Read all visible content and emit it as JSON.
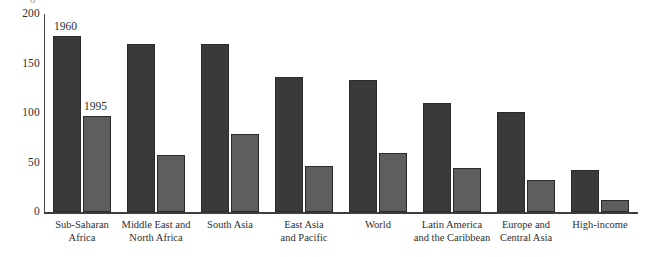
{
  "chart_data": {
    "type": "bar",
    "title": "",
    "xlabel": "",
    "ylabel": "",
    "ylim": [
      0,
      200
    ],
    "yticks": [
      0,
      50,
      100,
      150,
      200
    ],
    "grid": false,
    "legend_position": "inline-annotation",
    "categories": [
      "Sub-Saharan Africa",
      "Middle East and North Africa",
      "South Asia",
      "East Asia and Pacific",
      "World",
      "Latin America and the Caribbean",
      "Europe and Central Asia",
      "High-income"
    ],
    "category_lines": [
      [
        "Sub-Saharan",
        "Africa"
      ],
      [
        "Middle East and",
        "North Africa"
      ],
      [
        "South Asia"
      ],
      [
        "East Asia",
        "and Pacific"
      ],
      [
        "World"
      ],
      [
        "Latin America",
        "and the Caribbean"
      ],
      [
        "Europe and",
        "Central Asia"
      ],
      [
        "High-income"
      ]
    ],
    "series": [
      {
        "name": "1960",
        "color": "#3a3a3a",
        "values": [
          178,
          170,
          170,
          136,
          133,
          110,
          101,
          42
        ]
      },
      {
        "name": "1995",
        "color": "#5e5e5e",
        "values": [
          97,
          58,
          79,
          46,
          60,
          44,
          32,
          12
        ]
      }
    ],
    "annotations": [
      {
        "text": "1960",
        "series": "1960",
        "category_index": 0
      },
      {
        "text": "1995",
        "series": "1995",
        "category_index": 0
      }
    ],
    "axis_top_clipped_glyph": "0"
  },
  "ytick_labels": [
    "200",
    "150",
    "100",
    "50",
    "0"
  ]
}
